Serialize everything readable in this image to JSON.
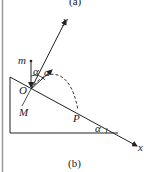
{
  "captions": {
    "top": "(a)",
    "bottom": "(b)"
  },
  "labels": {
    "y_axis": "y",
    "x_axis": "x",
    "mass": "m",
    "origin": "O",
    "point_M": "M",
    "point_P": "P",
    "angle_1": "α",
    "angle_2": "α",
    "angle_incline": "α"
  },
  "colors": {
    "line": "#222222",
    "border": "#9a9a9a"
  }
}
